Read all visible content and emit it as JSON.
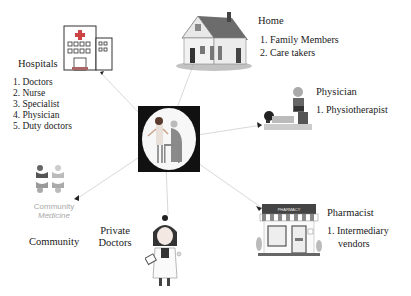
{
  "diagram": {
    "center": {
      "name": "caregiver-with-elderly-patient"
    },
    "nodes": {
      "hospitals": {
        "title": "Hospitals",
        "items": [
          "1. Doctors",
          "2. Nurse",
          "3. Specialist",
          "4. Physician",
          "5. Duty doctors"
        ]
      },
      "home": {
        "title": "Home",
        "items": [
          "1. Family Members",
          "2. Care takers"
        ]
      },
      "physician": {
        "title": "Physician",
        "items": [
          "1. Physiotherapist"
        ]
      },
      "pharmacist": {
        "title": "Pharmacist",
        "items": [
          "1. Intermediary",
          "vendors"
        ],
        "sign": "PHARMACY"
      },
      "private_doctors": {
        "title_line1": "Private",
        "title_line2": "Doctors"
      },
      "community": {
        "title": "Community",
        "logo_line1": "Community",
        "logo_line2": "Medicine"
      }
    },
    "colors": {
      "line": "#d8d8d8",
      "text": "#1a1a1a",
      "center_bg": "#111111"
    }
  }
}
